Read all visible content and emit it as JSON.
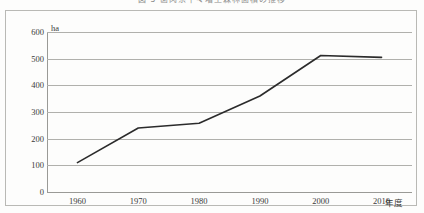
{
  "figure": {
    "caption_cropped": "図-5 歯肉系牛々増工森林面積の推移",
    "unit_label": "ha",
    "xaxis_title": "年度"
  },
  "chart_data": {
    "type": "line",
    "title": "図-5 歯肉系牛々増工森林面積の推移",
    "xlabel": "年度",
    "ylabel": "ha",
    "categories": [
      "1960",
      "1970",
      "1980",
      "1990",
      "2000",
      "2010"
    ],
    "x": [
      1960,
      1970,
      1980,
      1990,
      2000,
      2010
    ],
    "values": [
      110,
      240,
      258,
      360,
      512,
      505
    ],
    "series": [
      {
        "name": "森林面積",
        "values": [
          110,
          240,
          258,
          360,
          512,
          505
        ]
      }
    ],
    "ylim": [
      0,
      600
    ],
    "yticks": [
      0,
      100,
      200,
      300,
      400,
      500,
      600
    ],
    "xticks": [
      "1960",
      "1970",
      "1980",
      "1990",
      "2000",
      "2010"
    ],
    "xlim": [
      1955,
      2015
    ],
    "grid": "horizontal",
    "legend": "none",
    "line_color": "#2b2b2b",
    "grid_color": "#b0b0ac",
    "background_color": "#fdfdfc"
  }
}
